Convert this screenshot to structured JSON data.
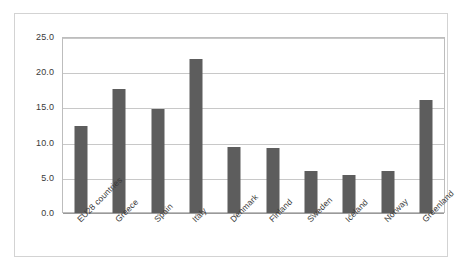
{
  "chart_data": {
    "type": "bar",
    "title": "",
    "subtitle": "",
    "xlabel": "",
    "ylabel": "",
    "categories": [
      "EU28 countries",
      "Greece",
      "Spain",
      "Italy",
      "Denmark",
      "Finland",
      "Sweden",
      "Iceland",
      "Norway",
      "Greenland"
    ],
    "values": [
      12.4,
      17.6,
      14.8,
      21.9,
      9.4,
      9.2,
      6.0,
      5.4,
      6.0,
      16.1
    ],
    "ylim": [
      0,
      25
    ],
    "ytick_labels": [
      "0.0",
      "5.0",
      "10.0",
      "15.0",
      "20.0",
      "25.0"
    ],
    "ytick_values": [
      0,
      5,
      10,
      15,
      20,
      25
    ],
    "grid": true,
    "legend": false,
    "legend_position": "none",
    "series": [
      {
        "name": "",
        "values": [
          12.4,
          17.6,
          14.8,
          21.9,
          9.4,
          9.2,
          6.0,
          5.4,
          6.0,
          16.1
        ]
      }
    ],
    "colors": {
      "bar": "#5d5d5d",
      "gridline": "#c8c8c8",
      "axis": "#9a9a9a",
      "plot_border": "#bdbdbd",
      "frame_border": "#d3d3d3",
      "background": "#ffffff",
      "text": "#3a3a3a"
    }
  }
}
